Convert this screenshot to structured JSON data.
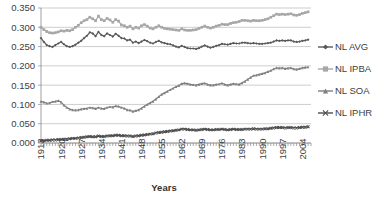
{
  "chart_data": {
    "type": "line",
    "title": "",
    "xlabel": "Years",
    "ylabel": "",
    "ylim": [
      0.0,
      0.35
    ],
    "ytick_labels": [
      "0.000",
      "0.050",
      "0.100",
      "0.150",
      "0.200",
      "0.250",
      "0.300",
      "0.350"
    ],
    "ytick_values": [
      0.0,
      0.05,
      0.1,
      0.15,
      0.2,
      0.25,
      0.3,
      0.35
    ],
    "xtick_labels": [
      "1913",
      "1920",
      "1927",
      "1934",
      "1941",
      "1948",
      "1955",
      "1962",
      "1969",
      "1976",
      "1983",
      "1990",
      "1997",
      "2004"
    ],
    "xtick_values": [
      1913,
      1920,
      1927,
      1934,
      1941,
      1948,
      1955,
      1962,
      1969,
      1976,
      1983,
      1990,
      1997,
      2004
    ],
    "xlim": [
      1913,
      2007
    ],
    "grid": true,
    "legend_position": "right",
    "legend": [
      "NL AVG",
      "NL IPBA",
      "NL SOA",
      "NL IPHR"
    ],
    "series": [
      {
        "name": "NL AVG",
        "color": "#595959",
        "marker": "diamond",
        "x": [
          1913,
          1914,
          1915,
          1916,
          1917,
          1918,
          1919,
          1920,
          1921,
          1922,
          1923,
          1924,
          1925,
          1926,
          1927,
          1928,
          1929,
          1930,
          1931,
          1932,
          1933,
          1934,
          1935,
          1936,
          1937,
          1938,
          1939,
          1940,
          1941,
          1942,
          1943,
          1944,
          1945,
          1946,
          1947,
          1948,
          1949,
          1950,
          1951,
          1952,
          1953,
          1954,
          1955,
          1956,
          1957,
          1958,
          1959,
          1960,
          1961,
          1962,
          1963,
          1964,
          1965,
          1966,
          1967,
          1968,
          1969,
          1970,
          1971,
          1972,
          1973,
          1974,
          1975,
          1976,
          1977,
          1978,
          1979,
          1980,
          1981,
          1982,
          1983,
          1984,
          1985,
          1986,
          1987,
          1988,
          1989,
          1990,
          1991,
          1992,
          1993,
          1994,
          1995,
          1996,
          1997,
          1998,
          1999,
          2000,
          2001,
          2002,
          2003,
          2004,
          2005,
          2006
        ],
        "values": [
          0.272,
          0.262,
          0.254,
          0.251,
          0.249,
          0.254,
          0.258,
          0.262,
          0.256,
          0.251,
          0.249,
          0.251,
          0.255,
          0.26,
          0.265,
          0.272,
          0.278,
          0.287,
          0.284,
          0.277,
          0.288,
          0.28,
          0.277,
          0.284,
          0.28,
          0.276,
          0.283,
          0.278,
          0.272,
          0.271,
          0.266,
          0.268,
          0.26,
          0.263,
          0.259,
          0.263,
          0.267,
          0.264,
          0.26,
          0.258,
          0.262,
          0.265,
          0.261,
          0.259,
          0.257,
          0.256,
          0.253,
          0.25,
          0.248,
          0.252,
          0.249,
          0.246,
          0.245,
          0.245,
          0.244,
          0.246,
          0.25,
          0.253,
          0.25,
          0.247,
          0.249,
          0.252,
          0.254,
          0.257,
          0.256,
          0.255,
          0.257,
          0.259,
          0.258,
          0.258,
          0.26,
          0.26,
          0.259,
          0.258,
          0.259,
          0.258,
          0.257,
          0.257,
          0.258,
          0.259,
          0.26,
          0.263,
          0.266,
          0.265,
          0.266,
          0.265,
          0.266,
          0.266,
          0.263,
          0.262,
          0.263,
          0.265,
          0.266,
          0.268
        ]
      },
      {
        "name": "NL IPBA",
        "color": "#a6a6a6",
        "marker": "square",
        "x": [
          1913,
          1914,
          1915,
          1916,
          1917,
          1918,
          1919,
          1920,
          1921,
          1922,
          1923,
          1924,
          1925,
          1926,
          1927,
          1928,
          1929,
          1930,
          1931,
          1932,
          1933,
          1934,
          1935,
          1936,
          1937,
          1938,
          1939,
          1940,
          1941,
          1942,
          1943,
          1944,
          1945,
          1946,
          1947,
          1948,
          1949,
          1950,
          1951,
          1952,
          1953,
          1954,
          1955,
          1956,
          1957,
          1958,
          1959,
          1960,
          1961,
          1962,
          1963,
          1964,
          1965,
          1966,
          1967,
          1968,
          1969,
          1970,
          1971,
          1972,
          1973,
          1974,
          1975,
          1976,
          1977,
          1978,
          1979,
          1980,
          1981,
          1982,
          1983,
          1984,
          1985,
          1986,
          1987,
          1988,
          1989,
          1990,
          1991,
          1992,
          1993,
          1994,
          1995,
          1996,
          1997,
          1998,
          1999,
          2000,
          2001,
          2002,
          2003,
          2004,
          2005,
          2006
        ],
        "values": [
          0.3,
          0.294,
          0.289,
          0.286,
          0.285,
          0.286,
          0.288,
          0.291,
          0.29,
          0.292,
          0.291,
          0.294,
          0.3,
          0.305,
          0.312,
          0.317,
          0.32,
          0.326,
          0.322,
          0.317,
          0.329,
          0.32,
          0.317,
          0.323,
          0.319,
          0.313,
          0.32,
          0.316,
          0.306,
          0.304,
          0.3,
          0.303,
          0.296,
          0.3,
          0.298,
          0.304,
          0.307,
          0.303,
          0.298,
          0.296,
          0.3,
          0.304,
          0.3,
          0.297,
          0.296,
          0.295,
          0.294,
          0.293,
          0.292,
          0.296,
          0.293,
          0.292,
          0.292,
          0.293,
          0.294,
          0.297,
          0.3,
          0.303,
          0.3,
          0.298,
          0.3,
          0.303,
          0.305,
          0.308,
          0.307,
          0.307,
          0.31,
          0.312,
          0.313,
          0.315,
          0.318,
          0.318,
          0.317,
          0.316,
          0.318,
          0.317,
          0.317,
          0.318,
          0.32,
          0.322,
          0.326,
          0.33,
          0.334,
          0.333,
          0.334,
          0.333,
          0.334,
          0.335,
          0.332,
          0.331,
          0.333,
          0.336,
          0.338,
          0.34
        ]
      },
      {
        "name": "NL SOA",
        "color": "#7f7f7f",
        "marker": "triangle",
        "x": [
          1913,
          1914,
          1915,
          1916,
          1917,
          1918,
          1919,
          1920,
          1921,
          1922,
          1923,
          1924,
          1925,
          1926,
          1927,
          1928,
          1929,
          1930,
          1931,
          1932,
          1933,
          1934,
          1935,
          1936,
          1937,
          1938,
          1939,
          1940,
          1941,
          1942,
          1943,
          1944,
          1945,
          1946,
          1947,
          1948,
          1949,
          1950,
          1951,
          1952,
          1953,
          1954,
          1955,
          1956,
          1957,
          1958,
          1959,
          1960,
          1961,
          1962,
          1963,
          1964,
          1965,
          1966,
          1967,
          1968,
          1969,
          1970,
          1971,
          1972,
          1973,
          1974,
          1975,
          1976,
          1977,
          1978,
          1979,
          1980,
          1981,
          1982,
          1983,
          1984,
          1985,
          1986,
          1987,
          1988,
          1989,
          1990,
          1991,
          1992,
          1993,
          1994,
          1995,
          1996,
          1997,
          1998,
          1999,
          2000,
          2001,
          2002,
          2003,
          2004,
          2005,
          2006
        ],
        "values": [
          0.108,
          0.106,
          0.103,
          0.104,
          0.107,
          0.108,
          0.11,
          0.106,
          0.098,
          0.092,
          0.088,
          0.086,
          0.085,
          0.086,
          0.088,
          0.089,
          0.09,
          0.092,
          0.091,
          0.089,
          0.092,
          0.09,
          0.089,
          0.092,
          0.094,
          0.093,
          0.096,
          0.095,
          0.092,
          0.09,
          0.086,
          0.085,
          0.082,
          0.084,
          0.086,
          0.09,
          0.095,
          0.1,
          0.104,
          0.108,
          0.114,
          0.12,
          0.126,
          0.13,
          0.134,
          0.138,
          0.142,
          0.146,
          0.149,
          0.154,
          0.155,
          0.154,
          0.152,
          0.151,
          0.15,
          0.152,
          0.154,
          0.155,
          0.152,
          0.15,
          0.15,
          0.152,
          0.153,
          0.155,
          0.152,
          0.15,
          0.152,
          0.154,
          0.153,
          0.152,
          0.156,
          0.16,
          0.165,
          0.17,
          0.175,
          0.176,
          0.178,
          0.18,
          0.182,
          0.185,
          0.188,
          0.192,
          0.195,
          0.194,
          0.195,
          0.193,
          0.194,
          0.195,
          0.192,
          0.191,
          0.193,
          0.195,
          0.196,
          0.197
        ]
      },
      {
        "name": "NL IPHR",
        "color": "#4d4d4d",
        "marker": "cross",
        "x": [
          1913,
          1914,
          1915,
          1916,
          1917,
          1918,
          1919,
          1920,
          1921,
          1922,
          1923,
          1924,
          1925,
          1926,
          1927,
          1928,
          1929,
          1930,
          1931,
          1932,
          1933,
          1934,
          1935,
          1936,
          1937,
          1938,
          1939,
          1940,
          1941,
          1942,
          1943,
          1944,
          1945,
          1946,
          1947,
          1948,
          1949,
          1950,
          1951,
          1952,
          1953,
          1954,
          1955,
          1956,
          1957,
          1958,
          1959,
          1960,
          1961,
          1962,
          1963,
          1964,
          1965,
          1966,
          1967,
          1968,
          1969,
          1970,
          1971,
          1972,
          1973,
          1974,
          1975,
          1976,
          1977,
          1978,
          1979,
          1980,
          1981,
          1982,
          1983,
          1984,
          1985,
          1986,
          1987,
          1988,
          1989,
          1990,
          1991,
          1992,
          1993,
          1994,
          1995,
          1996,
          1997,
          1998,
          1999,
          2000,
          2001,
          2002,
          2003,
          2004,
          2005,
          2006
        ],
        "values": [
          0.006,
          0.006,
          0.007,
          0.007,
          0.008,
          0.008,
          0.009,
          0.009,
          0.01,
          0.01,
          0.011,
          0.012,
          0.012,
          0.013,
          0.014,
          0.015,
          0.016,
          0.017,
          0.016,
          0.016,
          0.018,
          0.017,
          0.017,
          0.018,
          0.019,
          0.019,
          0.02,
          0.02,
          0.019,
          0.019,
          0.018,
          0.018,
          0.017,
          0.018,
          0.019,
          0.02,
          0.021,
          0.022,
          0.023,
          0.024,
          0.026,
          0.027,
          0.028,
          0.029,
          0.03,
          0.031,
          0.032,
          0.033,
          0.034,
          0.036,
          0.036,
          0.035,
          0.034,
          0.034,
          0.033,
          0.034,
          0.035,
          0.036,
          0.035,
          0.034,
          0.034,
          0.035,
          0.035,
          0.036,
          0.035,
          0.034,
          0.035,
          0.036,
          0.035,
          0.035,
          0.035,
          0.036,
          0.036,
          0.036,
          0.037,
          0.036,
          0.036,
          0.036,
          0.037,
          0.037,
          0.038,
          0.039,
          0.04,
          0.04,
          0.04,
          0.039,
          0.04,
          0.04,
          0.039,
          0.039,
          0.04,
          0.041,
          0.041,
          0.042
        ]
      }
    ]
  },
  "axis": {
    "x_title": "Years"
  }
}
